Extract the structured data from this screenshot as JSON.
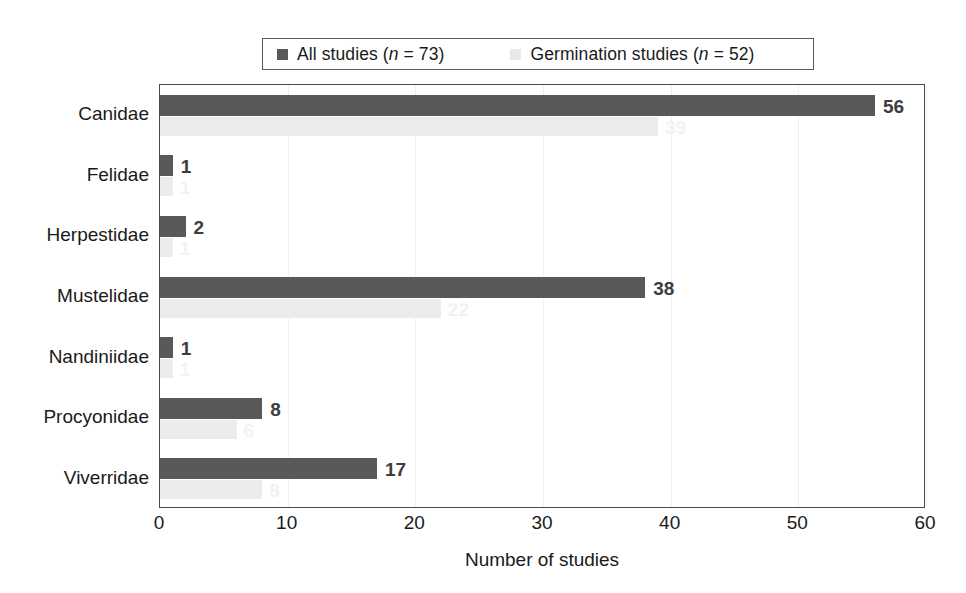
{
  "chart_data": {
    "type": "bar",
    "orientation": "horizontal",
    "title": "",
    "xlabel": "Number of studies",
    "ylabel": "",
    "xlim": [
      0,
      60
    ],
    "xticks": [
      "0",
      "10",
      "20",
      "30",
      "40",
      "50",
      "60"
    ],
    "grid": true,
    "grid_axis": "x",
    "legend_position": "top",
    "categories": [
      "Canidae",
      "Felidae",
      "Herpestidae",
      "Mustelidae",
      "Nandiniidae",
      "Procyonidae",
      "Viverridae"
    ],
    "series": [
      {
        "name": "All studies (n = 73)",
        "color": "#595959",
        "values": [
          56,
          1,
          2,
          38,
          1,
          8,
          17
        ],
        "labels": [
          "56",
          "1",
          "2",
          "38",
          "1",
          "8",
          "17"
        ]
      },
      {
        "name": "Germination studies (n = 52)",
        "color": "#ececec",
        "values": [
          39,
          1,
          1,
          22,
          1,
          6,
          8
        ],
        "labels": [
          "39",
          "1",
          "1",
          "22",
          "1",
          "6",
          "8"
        ]
      }
    ]
  },
  "legend": {
    "entries": [
      {
        "swatch": "dark",
        "text_before": "All studies (",
        "italic": "n",
        "text_after": " = 73)"
      },
      {
        "swatch": "light",
        "text_before": "Germination studies (",
        "italic": "n",
        "text_after": " = 52)"
      }
    ]
  },
  "axis": {
    "x_title": "Number of studies"
  }
}
